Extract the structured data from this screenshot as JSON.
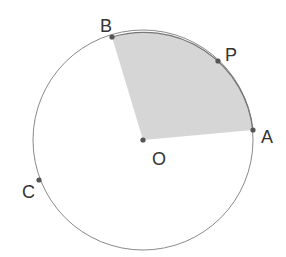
{
  "figure": {
    "colors": {
      "circle": "#8a8a8a",
      "sector_fill": "#d6d6d6",
      "point": "#555555",
      "label": "#333333"
    },
    "center": {
      "label": "O",
      "x": 143,
      "y": 140
    },
    "radius": 110,
    "points": [
      {
        "label": "A",
        "x": 253,
        "y": 130
      },
      {
        "label": "B",
        "x": 112,
        "y": 37
      },
      {
        "label": "P",
        "x": 218,
        "y": 61
      },
      {
        "label": "C",
        "x": 39,
        "y": 180
      }
    ],
    "shaded_sector": [
      "A",
      "O",
      "B"
    ]
  }
}
